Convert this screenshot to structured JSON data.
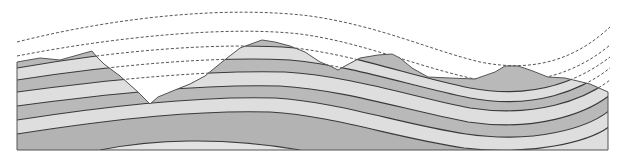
{
  "diagram": {
    "title": "",
    "type": "geological-cross-section",
    "colors": {
      "background": "#ffffff",
      "layer_dark": "#b9b9b9",
      "layer_light": "#dedede",
      "layer_core": "#b3b3b3",
      "core_lens": "#e2e2e2",
      "boundary_line": "#3a3a3a",
      "projection_dash": "#555555"
    },
    "layers": [
      {
        "name": "layer-1",
        "tone": "dark"
      },
      {
        "name": "layer-2",
        "tone": "light"
      },
      {
        "name": "layer-3",
        "tone": "dark"
      },
      {
        "name": "layer-4",
        "tone": "light"
      },
      {
        "name": "layer-5",
        "tone": "dark"
      },
      {
        "name": "layer-6",
        "tone": "light"
      },
      {
        "name": "core",
        "tone": "dark"
      }
    ],
    "projection_lines": 5,
    "labels": []
  }
}
